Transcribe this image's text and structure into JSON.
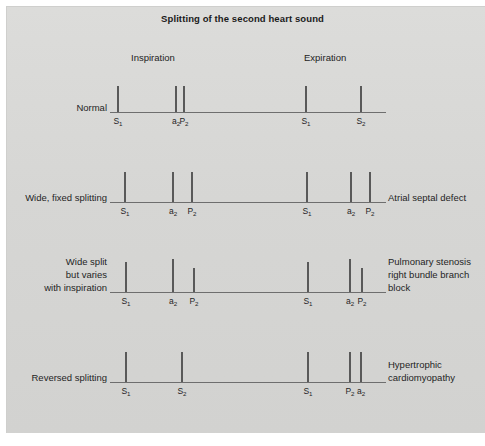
{
  "figure": {
    "title": "Splitting of the second heart sound",
    "background_color": "#d8d8d6",
    "tick_color": "#595959",
    "axis_color": "#6e6e6e",
    "phases": {
      "inspiration": "Inspiration",
      "expiration": "Expiration"
    }
  },
  "chart_data": {
    "type": "diagram",
    "title": "Splitting of the second heart sound",
    "axis_x_range": [
      110,
      386
    ],
    "phase_labels": [
      "Inspiration",
      "Expiration"
    ],
    "rows": [
      {
        "left_label": "Normal",
        "right_label": "",
        "baseline_y": 112,
        "ticks": [
          {
            "x": 117,
            "height": 26,
            "label": "S",
            "sub": "1",
            "phase": "inspiration"
          },
          {
            "x": 175,
            "height": 26,
            "label": "a",
            "sub": "2",
            "phase": "inspiration"
          },
          {
            "x": 183,
            "height": 26,
            "label": "P",
            "sub": "2",
            "phase": "inspiration"
          },
          {
            "x": 305,
            "height": 26,
            "label": "S",
            "sub": "1",
            "phase": "expiration"
          },
          {
            "x": 360,
            "height": 26,
            "label": "S",
            "sub": "2",
            "phase": "expiration"
          }
        ]
      },
      {
        "left_label": "Wide, fixed splitting",
        "right_label": "Atrial septal defect",
        "baseline_y": 202,
        "ticks": [
          {
            "x": 124,
            "height": 30,
            "label": "S",
            "sub": "1",
            "phase": "inspiration"
          },
          {
            "x": 172,
            "height": 30,
            "label": "a",
            "sub": "2",
            "phase": "inspiration"
          },
          {
            "x": 191,
            "height": 30,
            "label": "P",
            "sub": "2",
            "phase": "inspiration"
          },
          {
            "x": 306,
            "height": 30,
            "label": "S",
            "sub": "1",
            "phase": "expiration"
          },
          {
            "x": 350,
            "height": 30,
            "label": "a",
            "sub": "2",
            "phase": "expiration"
          },
          {
            "x": 369,
            "height": 30,
            "label": "P",
            "sub": "2",
            "phase": "expiration"
          }
        ]
      },
      {
        "left_label": "Wide split\nbut varies\nwith inspiration",
        "right_label": "Pulmonary stenosis\nright bundle branch\nblock",
        "baseline_y": 292,
        "ticks": [
          {
            "x": 125,
            "height": 30,
            "label": "S",
            "sub": "1",
            "phase": "inspiration"
          },
          {
            "x": 172,
            "height": 33,
            "label": "a",
            "sub": "2",
            "phase": "inspiration"
          },
          {
            "x": 193,
            "height": 24,
            "label": "P",
            "sub": "2",
            "phase": "inspiration"
          },
          {
            "x": 307,
            "height": 30,
            "label": "S",
            "sub": "1",
            "phase": "expiration"
          },
          {
            "x": 349,
            "height": 33,
            "label": "a",
            "sub": "2",
            "phase": "expiration"
          },
          {
            "x": 361,
            "height": 24,
            "label": "P",
            "sub": "2",
            "phase": "expiration"
          }
        ]
      },
      {
        "left_label": "Reversed splitting",
        "right_label": "Hypertrophic\ncardiomyopathy",
        "baseline_y": 382,
        "ticks": [
          {
            "x": 125,
            "height": 30,
            "label": "S",
            "sub": "1",
            "phase": "inspiration"
          },
          {
            "x": 181,
            "height": 30,
            "label": "S",
            "sub": "2",
            "phase": "inspiration"
          },
          {
            "x": 307,
            "height": 30,
            "label": "S",
            "sub": "1",
            "phase": "expiration"
          },
          {
            "x": 349,
            "height": 30,
            "label": "P",
            "sub": "2",
            "phase": "expiration"
          },
          {
            "x": 360,
            "height": 30,
            "label": "a",
            "sub": "2",
            "phase": "expiration"
          }
        ]
      }
    ]
  }
}
